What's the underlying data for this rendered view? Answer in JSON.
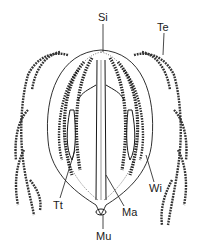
{
  "diagram": {
    "labels": [
      {
        "id": "si",
        "text": "Si",
        "x": 98,
        "y": 12
      },
      {
        "id": "te",
        "text": "Te",
        "x": 157,
        "y": 22
      },
      {
        "id": "tt",
        "text": "Tt",
        "x": 53,
        "y": 200
      },
      {
        "id": "ma",
        "text": "Ma",
        "x": 122,
        "y": 207
      },
      {
        "id": "wi",
        "text": "Wi",
        "x": 149,
        "y": 183
      },
      {
        "id": "mu",
        "text": "Mu",
        "x": 96,
        "y": 231
      }
    ],
    "colors": {
      "ink": "#1a1a1a",
      "background": "#ffffff"
    }
  }
}
